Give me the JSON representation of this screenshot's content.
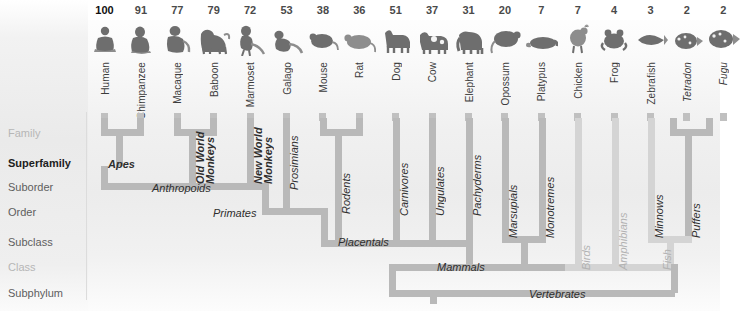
{
  "figure": {
    "type": "phylogenetic-tree",
    "title": "",
    "tip_count": 17
  },
  "columns": [
    {
      "number": "100",
      "species": "Human",
      "icon": "human-icon",
      "italic": false
    },
    {
      "number": "91",
      "species": "Chimpanzee",
      "icon": "chimpanzee-icon",
      "italic": false
    },
    {
      "number": "77",
      "species": "Macaque",
      "icon": "macaque-icon",
      "italic": false
    },
    {
      "number": "79",
      "species": "Baboon",
      "icon": "baboon-icon",
      "italic": false
    },
    {
      "number": "72",
      "species": "Marmoset",
      "icon": "marmoset-icon",
      "italic": false
    },
    {
      "number": "53",
      "species": "Galago",
      "icon": "galago-icon",
      "italic": false
    },
    {
      "number": "38",
      "species": "Mouse",
      "icon": "mouse-icon",
      "italic": false
    },
    {
      "number": "36",
      "species": "Rat",
      "icon": "rat-icon",
      "italic": false
    },
    {
      "number": "51",
      "species": "Dog",
      "icon": "dog-icon",
      "italic": false
    },
    {
      "number": "37",
      "species": "Cow",
      "icon": "cow-icon",
      "italic": false
    },
    {
      "number": "31",
      "species": "Elephant",
      "icon": "elephant-icon",
      "italic": false
    },
    {
      "number": "20",
      "species": "Opossum",
      "icon": "opossum-icon",
      "italic": false
    },
    {
      "number": "7",
      "species": "Platypus",
      "icon": "platypus-icon",
      "italic": false
    },
    {
      "number": "7",
      "species": "Chicken",
      "icon": "chicken-icon",
      "italic": false
    },
    {
      "number": "4",
      "species": "Frog",
      "icon": "frog-icon",
      "italic": false
    },
    {
      "number": "3",
      "species": "Zebrafish",
      "icon": "zebrafish-icon",
      "italic": false
    },
    {
      "number": "2",
      "species": "Tetradon",
      "icon": "tetradon-icon",
      "italic": true
    },
    {
      "number": "2",
      "species": "Fugu",
      "icon": "fugu-icon",
      "italic": true
    }
  ],
  "ranks": [
    {
      "label": "Family",
      "style": "faint"
    },
    {
      "label": "Superfamily",
      "style": "strong"
    },
    {
      "label": "Suborder",
      "style": "normal"
    },
    {
      "label": "Order",
      "style": "normal"
    },
    {
      "label": "Subclass",
      "style": "normal"
    },
    {
      "label": "Class",
      "style": "faint"
    },
    {
      "label": "Subphylum",
      "style": "normal"
    }
  ],
  "clades": {
    "apes": "Apes",
    "old_world_monkeys": "Old World",
    "old_world_monkeys2": "Monkeys",
    "new_world_monkeys": "New World",
    "new_world_monkeys2": "Monkeys",
    "prosimians": "Prosimians",
    "anthropoids": "Anthropoids",
    "primates": "Primates",
    "rodents": "Rodents",
    "carnivores": "Carnivores",
    "ungulates": "Ungulates",
    "pachyderms": "Pachyderms",
    "placentals": "Placentals",
    "marsupials": "Marsupials",
    "monotremes": "Monotremes",
    "mammals": "Mammals",
    "birds": "Birds",
    "amphibians": "Amphibians",
    "minnows": "Minnows",
    "puffers": "Puffers",
    "fish": "Fish",
    "vertebrates": "Vertebrates"
  },
  "colors": {
    "bar": "#b9b9b9",
    "bar_pale": "#d4d4d4",
    "label": "#2e2e2e",
    "label_dim": "#b2b2b2",
    "rank": "#5e5e5e"
  }
}
